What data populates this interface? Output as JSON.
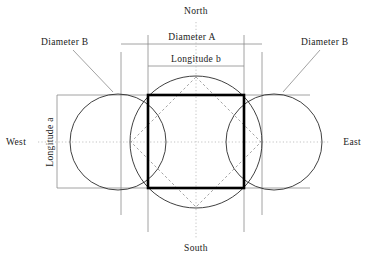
{
  "figure": {
    "cardinals": {
      "north": "North",
      "south": "South",
      "east": "East",
      "west": "West"
    },
    "dimensions": {
      "diameter_a": "Diameter A",
      "diameter_b_left": "Diameter B",
      "diameter_b_right": "Diameter B",
      "longitude_b": "Longitude b",
      "longitude_a": "Longitude a"
    },
    "colors": {
      "outline": "#2b2b2b",
      "bold_square": "#000000",
      "guide_line": "#8a8a8a",
      "dashed": "#9a9a9a",
      "axis_dotted": "#b4b4b4",
      "background": "#ffffff",
      "text": "#1a1a1a"
    },
    "geometry": {
      "center_circle": {
        "cx": 196,
        "cy": 142,
        "r": 66
      },
      "left_circle": {
        "cx": 118,
        "cy": 142,
        "r": 48
      },
      "right_circle": {
        "cx": 274,
        "cy": 142,
        "r": 48
      },
      "bold_square": {
        "x": 148,
        "y": 95,
        "width": 96,
        "height": 93
      },
      "dashed_diamond": {
        "cx": 196,
        "cy": 142,
        "rx": 66,
        "ry": 65
      },
      "vertical_guides": [
        121,
        148,
        244,
        262,
        196
      ],
      "horizontal_guides": [
        95,
        188,
        142
      ]
    }
  }
}
